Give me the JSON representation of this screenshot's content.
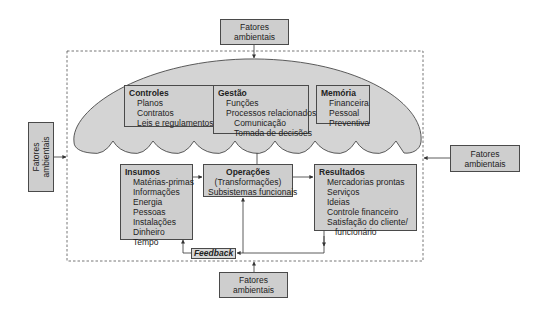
{
  "colors": {
    "box_fill": "#cecece",
    "cloud_fill": "#d4d4d4",
    "border": "#4a4a4a",
    "dashed": "#666666"
  },
  "environment": {
    "top": [
      "Fatores",
      "ambientais"
    ],
    "left": [
      "Fatores",
      "ambientais"
    ],
    "right": [
      "Fatores",
      "ambientais"
    ],
    "bottom": [
      "Fatores",
      "ambientais"
    ]
  },
  "cloud": {
    "controles": {
      "title": "Controles",
      "items": [
        "Planos",
        "Contratos",
        "Leis e regulamentos"
      ]
    },
    "gestao": {
      "title": "Gestão",
      "items": [
        "Funções",
        "Processos relacionados"
      ],
      "subitems": [
        "Comunicação",
        "Tomada de decisões"
      ]
    },
    "memoria": {
      "title": "Memória",
      "items": [
        "Financeira",
        "Pessoal",
        "Preventiva"
      ]
    }
  },
  "insumos": {
    "title": "Insumos",
    "items": [
      "Matérias-primas",
      "Informações",
      "Energia",
      "Pessoas",
      "Instalações",
      "Dinheiro",
      "Tempo"
    ]
  },
  "operacoes": {
    "title": "Operações",
    "lines": [
      "(Transformações)",
      "Subsistemas funcionais"
    ]
  },
  "resultados": {
    "title": "Resultados",
    "items": [
      "Mercadorias prontas",
      "Serviços",
      "Ideias",
      "Controle financeiro",
      "Satisfação do cliente/"
    ],
    "subitems": [
      "funcionário"
    ]
  },
  "feedback": {
    "label": "Feedback"
  }
}
